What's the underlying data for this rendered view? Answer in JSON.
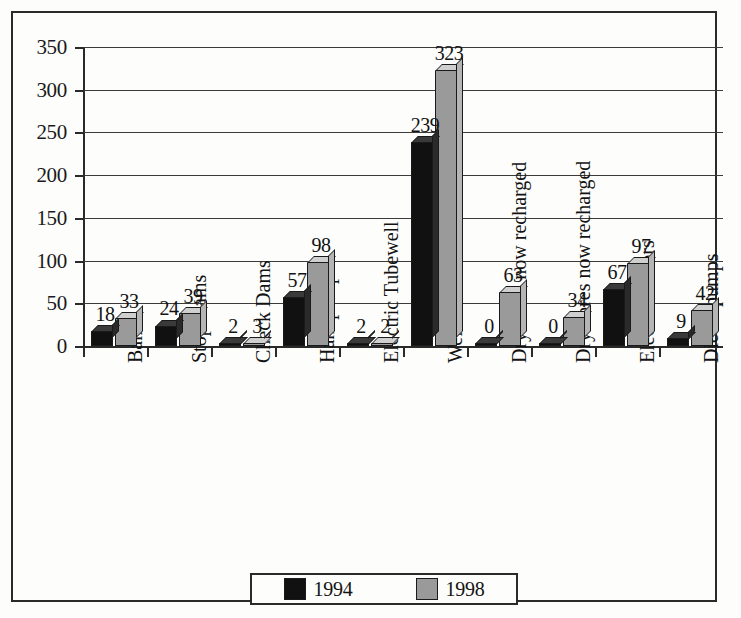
{
  "chart_data": {
    "type": "bar",
    "title": "",
    "subtitle": "",
    "xlabel": "",
    "ylabel": "",
    "ylim": [
      0,
      350
    ],
    "yticks": [
      0,
      50,
      100,
      150,
      200,
      250,
      300,
      350
    ],
    "grid": true,
    "legend_position": "bottom",
    "categories": [
      "Banks",
      "Stop Dams",
      "Check Dams",
      "Handpumps",
      "Electric Tubewell",
      "Wells",
      "Dry wells now recharged",
      "Dry bores now recharged",
      "Electric motors",
      "Diesel pumps"
    ],
    "series": [
      {
        "name": "1994",
        "color": "#111111",
        "values": [
          18,
          24,
          2,
          57,
          2,
          239,
          0,
          0,
          67,
          9
        ]
      },
      {
        "name": "1998",
        "color": "#9a9a9a",
        "values": [
          33,
          39,
          3,
          98,
          2,
          323,
          63,
          34,
          97,
          42
        ]
      }
    ]
  },
  "legend": {
    "entries": [
      {
        "label": "1994",
        "color": "#111111"
      },
      {
        "label": "1998",
        "color": "#9a9a9a"
      }
    ]
  }
}
